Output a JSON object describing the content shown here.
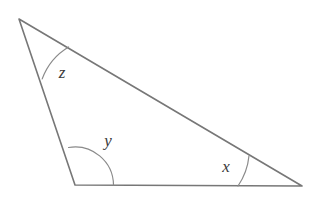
{
  "figure": {
    "type": "geometry-diagram",
    "background_color": "#ffffff",
    "stroke_color": "#777777",
    "arc_color": "#8a8a8a",
    "label_color": "#3a3a3a",
    "stroke_width": 1.6,
    "arc_width": 1.2,
    "canvas": {
      "width": 313,
      "height": 198
    }
  },
  "shape": {
    "name": "triangle",
    "vertices": [
      {
        "id": "apex",
        "label": "z",
        "x": 19,
        "y": 19
      },
      {
        "id": "bottom-left",
        "label": "y",
        "x": 75,
        "y": 185
      },
      {
        "id": "bottom-right",
        "label": "x",
        "x": 302,
        "y": 186
      }
    ],
    "edges": [
      {
        "id": "top-edge",
        "from": "apex",
        "to": "bottom-right"
      },
      {
        "id": "left-edge",
        "from": "apex",
        "to": "bottom-left"
      },
      {
        "id": "bottom-edge",
        "from": "bottom-left",
        "to": "bottom-right"
      }
    ],
    "path": "M 19 19 L 302 186 L 75 185 Z"
  },
  "angles": [
    {
      "id": "angle-z",
      "label": "z",
      "vertex": "apex",
      "arc_path": "M 42.2 78.9 A 62 62 0 0 1 68.6 47.0",
      "label_x": 62,
      "label_y": 72
    },
    {
      "id": "angle-y",
      "label": "y",
      "vertex": "bottom-left",
      "arc_path": "M 68.5 147.5 A 38.5 38.5 0 0 1 113.5 185.0",
      "label_x": 108,
      "label_y": 140
    },
    {
      "id": "angle-x",
      "label": "x",
      "vertex": "bottom-right",
      "arc_path": "M 249.0 155.8 A 64 64 0 0 1 238.0 186.0",
      "label_x": 226,
      "label_y": 166
    }
  ]
}
